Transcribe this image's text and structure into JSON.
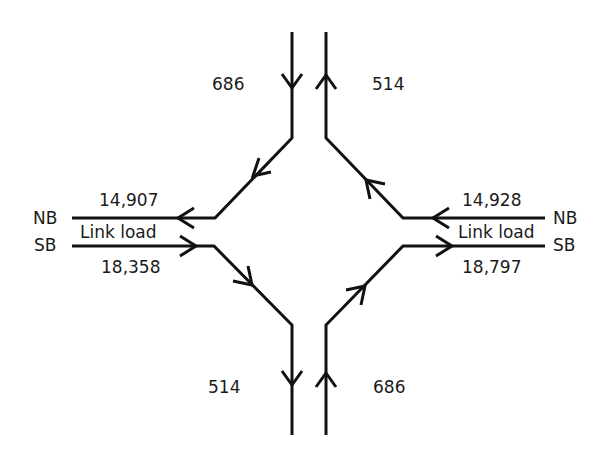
{
  "diagram": {
    "colors": {
      "line": "#111111",
      "text": "#1a1a1a",
      "background": "#ffffff"
    },
    "west": {
      "nb_label": "NB",
      "sb_label": "SB",
      "nb_volume": "14,907",
      "sb_volume": "18,358",
      "link_label": "Link load"
    },
    "east": {
      "nb_label": "NB",
      "sb_label": "SB",
      "nb_volume": "14,928",
      "sb_volume": "18,797",
      "link_label": "Link load"
    },
    "ramps": {
      "top_left_in": "686",
      "top_right_out": "514",
      "bottom_left_out": "514",
      "bottom_right_in": "686"
    }
  }
}
